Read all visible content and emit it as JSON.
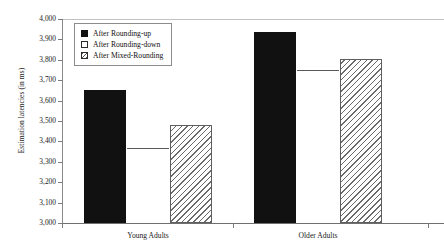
{
  "chart_data": {
    "type": "bar",
    "title": "",
    "xlabel": "",
    "ylabel": "Estimation latencies (in ms)",
    "ylim": [
      3000,
      4000
    ],
    "ytick_step": 100,
    "grid": false,
    "legend_position": "inside-top-left",
    "categories": [
      "Young Adults",
      "Older Adults"
    ],
    "ytick_labels": [
      "4,000",
      "3,900",
      "3,800",
      "3,700",
      "3,600",
      "3,500",
      "3,400",
      "3,300",
      "3,200",
      "3,100",
      "3,000"
    ],
    "ytick_values": [
      4000,
      3900,
      3800,
      3700,
      3600,
      3500,
      3400,
      3300,
      3200,
      3100,
      3000
    ],
    "series": [
      {
        "name": "After Rounding-up",
        "fill": "solid-black",
        "color": "#111111",
        "values": [
          3650,
          3935
        ]
      },
      {
        "name": "After Rounding-down",
        "fill": "open-white",
        "color": "#ffffff",
        "values": [
          3370,
          3750
        ]
      },
      {
        "name": "After Mixed-Rounding",
        "fill": "diagonal-hatch",
        "color": "#6a6a6a",
        "values": [
          3480,
          3805
        ]
      }
    ]
  },
  "legend": {
    "items": [
      {
        "label": "After Rounding-up"
      },
      {
        "label": "After Rounding-down"
      },
      {
        "label": "After Mixed-Rounding"
      }
    ]
  },
  "axis": {
    "y_title": "Estimation latencies (in ms)",
    "y_labels": [
      "4,000",
      "3,900",
      "3,800",
      "3,700",
      "3,600",
      "3,500",
      "3,400",
      "3,300",
      "3,200",
      "3,100",
      "3,000"
    ],
    "x_labels": [
      "Young Adults",
      "Older Adults"
    ]
  }
}
